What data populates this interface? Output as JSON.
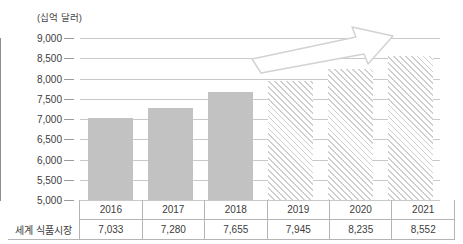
{
  "chart_data": {
    "type": "bar",
    "title": "",
    "subtitle": "",
    "unit_caption": "(십억 달러)",
    "xlabel": "",
    "ylabel": "",
    "categories": [
      "2016",
      "2017",
      "2018",
      "2019",
      "2020",
      "2021"
    ],
    "values": [
      7033,
      7280,
      7655,
      7945,
      8235,
      8552
    ],
    "value_labels": [
      "7,033",
      "7,280",
      "7,655",
      "7,945",
      "8,235",
      "8,552"
    ],
    "series": [
      {
        "name": "세계 식품시장",
        "values": [
          7033,
          7280,
          7655,
          7945,
          8235,
          8552
        ],
        "styles": [
          "solid",
          "solid",
          "solid",
          "hatched",
          "hatched",
          "hatched"
        ]
      }
    ],
    "ylim": [
      5000,
      9000
    ],
    "ytick_step": 500,
    "yticks": [
      9000,
      8500,
      8000,
      7500,
      7000,
      6500,
      6000,
      5500,
      5000
    ],
    "ytick_labels": [
      "9,000",
      "8,500",
      "8,000",
      "7,500",
      "7,000",
      "6,500",
      "6,000",
      "5,500",
      "5,000"
    ],
    "grid": true,
    "legend": "none",
    "annotations": [
      {
        "name": "growth-trend-arrow",
        "shape": "block-arrow",
        "direction": "up-right",
        "style": "outlined"
      }
    ],
    "colors": {
      "bar_actual": "#c2c2c2",
      "bar_forecast_hatch": "#cfcfcf",
      "gridline": "#c9c9c9",
      "axis": "#8f8f8f",
      "text": "#3c3c3c",
      "table_border": "#b4b4b4"
    }
  },
  "table": {
    "row_label": "세계 식품시장",
    "headers": [
      "2016",
      "2017",
      "2018",
      "2019",
      "2020",
      "2021"
    ],
    "values": [
      "7,033",
      "7,280",
      "7,655",
      "7,945",
      "8,235",
      "8,552"
    ]
  }
}
